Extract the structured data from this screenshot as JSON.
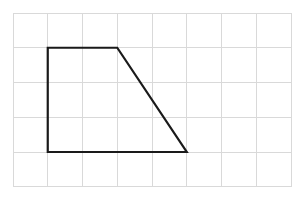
{
  "figure": {
    "background_color": "#ffffff",
    "grid": {
      "name": "square-grid",
      "columns": 8,
      "rows": 5,
      "cell_size_px": 34.75,
      "origin_x_px": 13,
      "origin_y_px": 13,
      "width_px": 278,
      "height_px": 173.75,
      "line_color": "#d9d9d9",
      "line_width_px": 1,
      "visible": true
    },
    "shape": {
      "name": "trapezoid",
      "type": "polygon",
      "stroke_color": "#1a1a1a",
      "stroke_width_px": 2.2,
      "fill": "none",
      "closed": true,
      "vertex_count": 4,
      "vertices_grid": [
        {
          "label": "top-left",
          "col": 1,
          "row": 1
        },
        {
          "label": "top-right",
          "col": 3,
          "row": 1
        },
        {
          "label": "bottom-right",
          "col": 5,
          "row": 4
        },
        {
          "label": "bottom-left",
          "col": 1,
          "row": 4
        }
      ],
      "vertices_px": [
        {
          "label": "top-left",
          "x": 47.75,
          "y": 47.75
        },
        {
          "label": "top-right",
          "x": 117.25,
          "y": 47.75
        },
        {
          "label": "bottom-right",
          "x": 186.75,
          "y": 152.0
        },
        {
          "label": "bottom-left",
          "x": 47.75,
          "y": 152.0
        }
      ],
      "points_attr": "47.75,47.75 117.25,47.75 186.75,152 47.75,152",
      "edges": [
        {
          "name": "top-edge",
          "length_cells": 2,
          "orientation": "horizontal"
        },
        {
          "name": "right-slant-edge",
          "length_cells": 3.6,
          "orientation": "diagonal"
        },
        {
          "name": "bottom-edge",
          "length_cells": 4,
          "orientation": "horizontal"
        },
        {
          "name": "left-edge",
          "length_cells": 3,
          "orientation": "vertical"
        }
      ]
    },
    "chart_data": {
      "type": "scatter",
      "title": "Trapezoid on a grid",
      "xlabel": "",
      "ylabel": "",
      "xlim": [
        0,
        8
      ],
      "ylim": [
        0,
        5
      ],
      "grid": true,
      "legend": "none",
      "series": [
        {
          "name": "trapezoid-vertices",
          "x": [
            1,
            3,
            5,
            1
          ],
          "y": [
            4,
            4,
            1,
            1
          ]
        }
      ],
      "annotations": []
    }
  }
}
